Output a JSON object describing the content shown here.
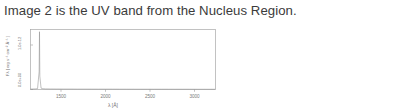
{
  "caption": {
    "text": "Image 2 is the UV band from the Nucleus Region."
  },
  "chart_data": {
    "type": "line",
    "title": "",
    "subtitle": "",
    "xlabel": "λ [Å]",
    "ylabel": "Fλ [ erg s⁻¹ cm⁻² Å⁻¹ ]",
    "xlim": [
      1150,
      3250
    ],
    "ylim": [
      0,
      1.35e-12
    ],
    "xticks": [
      1500,
      2000,
      2500,
      3000
    ],
    "xticklabels": [
      "1500",
      "2000",
      "2500",
      "3000"
    ],
    "yticks": [
      0,
      1e-12
    ],
    "yticklabels": [
      "0.0e+00",
      "1.0e-12"
    ],
    "grid": false,
    "legend": false,
    "series": [
      {
        "name": "Nucleus Region UV spectrum",
        "color": "#8d8d8d",
        "x": [
          1150,
          1190,
          1210,
          1230,
          1248,
          1252,
          1256,
          1270,
          1290,
          1320,
          1380,
          1450,
          1520,
          1600,
          1680,
          1760,
          1840,
          1920,
          2000,
          2080,
          2160,
          2240,
          2320,
          2400,
          2480,
          2560,
          2640,
          2720,
          2800,
          2880,
          2960,
          3040,
          3120,
          3200,
          3250
        ],
        "y": [
          1e-14,
          1.2e-14,
          1.5e-14,
          2e-14,
          4e-13,
          1.3e-12,
          3e-13,
          3e-14,
          1.8e-14,
          1.4e-14,
          1.2e-14,
          1.1e-14,
          1e-14,
          1e-14,
          9e-15,
          9e-15,
          8.5e-15,
          8e-15,
          8e-15,
          8e-15,
          7.5e-15,
          7.5e-15,
          7e-15,
          7e-15,
          7e-15,
          6.5e-15,
          6.5e-15,
          6.5e-15,
          6e-15,
          6e-15,
          6e-15,
          5.5e-15,
          5.5e-15,
          5.5e-15,
          5e-15
        ]
      }
    ],
    "annotations": [
      {
        "name": "emission-spike",
        "x": 1252,
        "y": 1.3e-12,
        "label": ""
      }
    ]
  }
}
